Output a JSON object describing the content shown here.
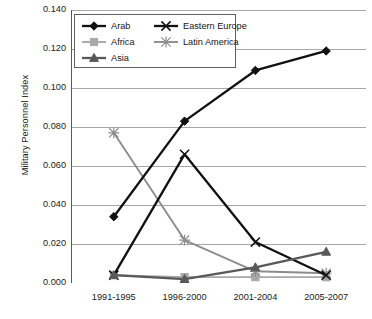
{
  "chart_data": {
    "type": "line",
    "title": "",
    "xlabel": "",
    "ylabel": "Military Personnel Index",
    "categories": [
      "1991-1995",
      "1996-2000",
      "2001-2004",
      "2005-2007"
    ],
    "ylim": [
      0.0,
      0.14
    ],
    "ytick_step": 0.02,
    "ytick_labels": [
      "0.140",
      "0.120",
      "0.100",
      "0.080",
      "0.060",
      "0.040",
      "0.020",
      "0.000"
    ],
    "ytick_values": [
      0.14,
      0.12,
      0.1,
      0.08,
      0.06,
      0.04,
      0.02,
      0.0
    ],
    "grid": "horizontal",
    "legend_position": "top-left-inside",
    "series": [
      {
        "name": "Arab",
        "color": "#111111",
        "marker": "diamond",
        "values": [
          0.034,
          0.083,
          0.109,
          0.119
        ]
      },
      {
        "name": "Africa",
        "color": "#a8a8a8",
        "marker": "square",
        "values": [
          0.004,
          0.003,
          0.003,
          0.003
        ]
      },
      {
        "name": "Asia",
        "color": "#595959",
        "marker": "triangle",
        "values": [
          0.004,
          0.002,
          0.008,
          0.016
        ]
      },
      {
        "name": "Eastern Europe",
        "color": "#111111",
        "marker": "x",
        "values": [
          0.004,
          0.066,
          0.021,
          0.004
        ]
      },
      {
        "name": "Latin America",
        "color": "#8d8d8d",
        "marker": "asterisk",
        "values": [
          0.077,
          0.022,
          0.006,
          0.005
        ]
      }
    ]
  },
  "legend": {
    "entries": [
      {
        "label": "Arab"
      },
      {
        "label": "Africa"
      },
      {
        "label": "Asia"
      },
      {
        "label": "Eastern Europe"
      },
      {
        "label": "Latin America"
      }
    ]
  },
  "axis": {
    "y_title": "Military Personnel Index"
  }
}
